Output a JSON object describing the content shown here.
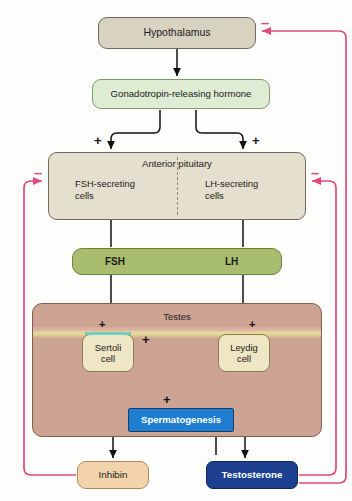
{
  "diagram": {
    "colors": {
      "hypothalamus_fill": "#d8d2c0",
      "gnrh_fill": "#ddecd2",
      "pituitary_fill": "#e5dfcd",
      "hormone_bar_fill": "#a8bd6e",
      "testes_fill": "#cda393",
      "cell_fill": "#efe6c4",
      "spermatogenesis_fill": "#1f7ed0",
      "inhibin_fill": "#f3d3ab",
      "testosterone_fill": "#1c3f8f",
      "stimulatory_arrow": "#111111",
      "inhibitory_arrow": "#e0487f"
    }
  },
  "nodes": {
    "hypothalamus": {
      "label": "Hypothalamus"
    },
    "gnrh": {
      "label": "Gonadotropin-releasing hormone"
    },
    "anterior_pituitary": {
      "title": "Anterior pituitary",
      "fsh_cells": "FSH-secreting\ncells",
      "fsh_cells_line1": "FSH-secreting",
      "fsh_cells_line2": "cells",
      "lh_cells_line1": "LH-secreting",
      "lh_cells_line2": "cells"
    },
    "hormones": {
      "fsh": "FSH",
      "lh": "LH"
    },
    "testes": {
      "title": "Testes",
      "sertoli_line1": "Sertoli",
      "sertoli_line2": "cell",
      "leydig_line1": "Leydig",
      "leydig_line2": "cell"
    },
    "spermatogenesis": {
      "label": "Spermatogenesis"
    },
    "inhibin": {
      "label": "Inhibin"
    },
    "testosterone": {
      "label": "Testosterone"
    }
  },
  "signs": {
    "plus": "+",
    "minus": "–"
  },
  "sign_markers": [
    {
      "name": "plus-gnrh-to-fsh-cells",
      "symbol": "+"
    },
    {
      "name": "plus-gnrh-to-lh-cells",
      "symbol": "+"
    },
    {
      "name": "plus-fsh-to-sertoli",
      "symbol": "+"
    },
    {
      "name": "plus-lh-to-leydig",
      "symbol": "+"
    },
    {
      "name": "plus-testosterone-to-sertoli",
      "symbol": "+"
    },
    {
      "name": "plus-to-spermatogenesis",
      "symbol": "+"
    },
    {
      "name": "minus-inhibin-to-pituitary",
      "symbol": "–"
    },
    {
      "name": "minus-testosterone-to-pituitary",
      "symbol": "–"
    },
    {
      "name": "minus-testosterone-to-hypothalamus",
      "symbol": "–"
    }
  ],
  "edges": [
    {
      "name": "hypothalamus-to-gnrh",
      "from": "Hypothalamus",
      "to": "Gonadotropin-releasing hormone",
      "sign": ""
    },
    {
      "name": "gnrh-to-fsh-cells",
      "from": "Gonadotropin-releasing hormone",
      "to": "FSH-secreting cells",
      "sign": "+"
    },
    {
      "name": "gnrh-to-lh-cells",
      "from": "Gonadotropin-releasing hormone",
      "to": "LH-secreting cells",
      "sign": "+"
    },
    {
      "name": "fsh-cells-to-fsh",
      "from": "FSH-secreting cells",
      "to": "FSH",
      "sign": ""
    },
    {
      "name": "lh-cells-to-lh",
      "from": "LH-secreting cells",
      "to": "LH",
      "sign": ""
    },
    {
      "name": "fsh-to-sertoli",
      "from": "FSH",
      "to": "Sertoli cell",
      "sign": "+"
    },
    {
      "name": "lh-to-leydig",
      "from": "LH",
      "to": "Leydig cell",
      "sign": "+"
    },
    {
      "name": "leydig-to-sertoli",
      "from": "Leydig cell",
      "to": "Sertoli cell",
      "sign": "+"
    },
    {
      "name": "sertoli-to-spermatogenesis",
      "from": "Sertoli cell",
      "to": "Spermatogenesis",
      "sign": "+"
    },
    {
      "name": "leydig-to-spermatogenesis",
      "from": "Leydig cell",
      "to": "Spermatogenesis",
      "sign": "+"
    },
    {
      "name": "sertoli-to-inhibin",
      "from": "Sertoli cell",
      "to": "Inhibin",
      "sign": ""
    },
    {
      "name": "leydig-to-testosterone",
      "from": "Leydig cell",
      "to": "Testosterone",
      "sign": ""
    },
    {
      "name": "inhibin-to-pituitary",
      "from": "Inhibin",
      "to": "Anterior pituitary",
      "sign": "–"
    },
    {
      "name": "testosterone-to-pituitary",
      "from": "Testosterone",
      "to": "Anterior pituitary",
      "sign": "–"
    },
    {
      "name": "testosterone-to-hypothalamus",
      "from": "Testosterone",
      "to": "Hypothalamus",
      "sign": "–"
    }
  ]
}
